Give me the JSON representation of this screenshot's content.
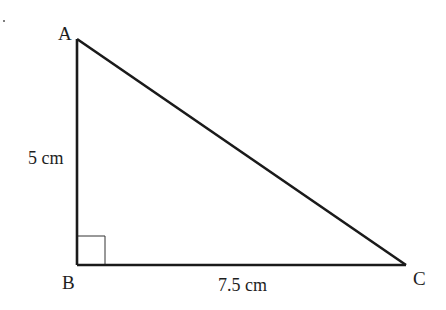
{
  "diagram": {
    "type": "right-triangle",
    "vertices": [
      {
        "name": "A",
        "label": "A",
        "x": 77,
        "y": 39
      },
      {
        "name": "B",
        "label": "B",
        "x": 77,
        "y": 265
      },
      {
        "name": "C",
        "label": "C",
        "x": 406,
        "y": 265
      }
    ],
    "right_angle_at": "B",
    "sides": {
      "AB": {
        "label": "5 cm"
      },
      "BC": {
        "label": "7.5 cm"
      }
    },
    "colors": {
      "stroke": "#1a1a1a",
      "text": "#1e1e1e",
      "background": "#ffffff"
    }
  }
}
